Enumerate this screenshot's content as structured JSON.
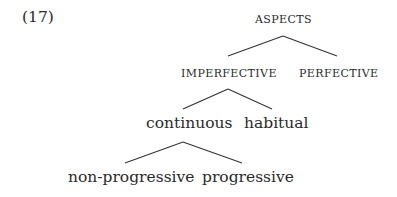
{
  "example_number": "(17)",
  "tree": {
    "root": {
      "label": "ASPECTS"
    },
    "level1": [
      {
        "label": "IMPERFECTIVE"
      },
      {
        "label": "PERFECTIVE"
      }
    ],
    "level2": [
      {
        "label": "continuous"
      },
      {
        "label": "habitual"
      }
    ],
    "level3": [
      {
        "label": "non-progressive"
      },
      {
        "label": "progressive"
      }
    ]
  }
}
